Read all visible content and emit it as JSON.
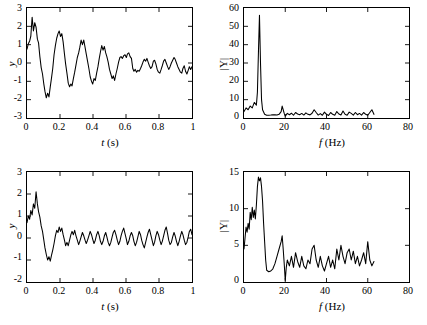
{
  "figure": {
    "background": "#ffffff",
    "line_color": "#000000",
    "panel_count": 4
  },
  "chart_data": [
    {
      "id": "top-left",
      "type": "line",
      "title": "",
      "xlabel": "t (s)",
      "ylabel": "y",
      "xlim": [
        0,
        1
      ],
      "ylim": [
        -3,
        3
      ],
      "xticks": [
        0,
        0.2,
        0.4,
        0.6,
        0.8,
        1
      ],
      "xticklabels": [
        "0",
        "0.2",
        "0.4",
        "0.6",
        "0.8",
        "1"
      ],
      "yticks": [
        -3,
        -2,
        -1,
        0,
        1,
        2,
        3
      ],
      "yticklabels": [
        "-3",
        "-2",
        "-1",
        "0",
        "1",
        "2",
        "3"
      ],
      "grid": false,
      "legend": "none",
      "description": "Noisy damped oscillation, ~7 Hz, decaying from amplitude 2.5 to noise",
      "x": [
        0,
        0.008,
        0.016,
        0.023,
        0.031,
        0.039,
        0.047,
        0.055,
        0.063,
        0.07,
        0.078,
        0.086,
        0.094,
        0.102,
        0.109,
        0.117,
        0.125,
        0.133,
        0.141,
        0.148,
        0.156,
        0.164,
        0.172,
        0.18,
        0.188,
        0.195,
        0.203,
        0.211,
        0.219,
        0.227,
        0.234,
        0.242,
        0.25,
        0.258,
        0.266,
        0.273,
        0.281,
        0.289,
        0.297,
        0.305,
        0.313,
        0.32,
        0.328,
        0.336,
        0.344,
        0.352,
        0.359,
        0.367,
        0.375,
        0.383,
        0.391,
        0.398,
        0.406,
        0.414,
        0.422,
        0.43,
        0.438,
        0.445,
        0.453,
        0.461,
        0.469,
        0.477,
        0.484,
        0.492,
        0.5,
        0.508,
        0.516,
        0.523,
        0.531,
        0.539,
        0.547,
        0.555,
        0.563,
        0.57,
        0.578,
        0.586,
        0.594,
        0.602,
        0.609,
        0.617,
        0.625,
        0.633,
        0.641,
        0.648,
        0.656,
        0.664,
        0.672,
        0.68,
        0.688,
        0.695,
        0.703,
        0.711,
        0.719,
        0.727,
        0.734,
        0.742,
        0.75,
        0.758,
        0.766,
        0.773,
        0.781,
        0.789,
        0.797,
        0.805,
        0.813,
        0.82,
        0.828,
        0.836,
        0.844,
        0.852,
        0.859,
        0.867,
        0.875,
        0.883,
        0.891,
        0.898,
        0.906,
        0.914,
        0.922,
        0.93,
        0.938,
        0.945,
        0.953,
        0.961,
        0.969,
        0.977,
        0.984,
        0.992,
        1
      ],
      "y": [
        0.75,
        1.05,
        1.2,
        1.45,
        2.5,
        1.75,
        2.2,
        1.95,
        1.3,
        1.1,
        0.35,
        -0.25,
        -0.6,
        -1.15,
        -1.55,
        -1.9,
        -1.65,
        -1.85,
        -1.3,
        -0.85,
        -0.3,
        0.45,
        0.95,
        1.35,
        1.6,
        1.75,
        1.45,
        1.6,
        1.15,
        0.5,
        -0.05,
        -0.55,
        -1.1,
        -1.3,
        -1.15,
        -1.25,
        -0.85,
        -0.5,
        -0.1,
        0.3,
        0.55,
        0.85,
        1.25,
        1.0,
        1.25,
        0.85,
        0.5,
        0.1,
        -0.3,
        -0.75,
        -1.0,
        -1.15,
        -0.85,
        -0.95,
        -0.55,
        -0.2,
        0.25,
        0.6,
        0.95,
        0.7,
        0.9,
        0.55,
        0.35,
        0.05,
        -0.35,
        -0.6,
        -0.85,
        -0.7,
        -0.95,
        -0.6,
        -0.3,
        0.05,
        0.3,
        0.35,
        0.25,
        0.4,
        0.45,
        0.3,
        0.5,
        0.55,
        0.35,
        0.25,
        -0.3,
        -0.45,
        -0.35,
        -0.5,
        -0.4,
        -0.45,
        -0.3,
        -0.15,
        0.05,
        0.2,
        0.1,
        0.25,
        0.05,
        -0.15,
        -0.3,
        -0.2,
        0.1,
        0.15,
        -0.05,
        -0.35,
        -0.5,
        -0.55,
        -0.35,
        -0.15,
        0.1,
        0.2,
        0.0,
        -0.2,
        -0.35,
        -0.2,
        0.0,
        0.15,
        0.3,
        0.2,
        0.0,
        -0.2,
        -0.35,
        -0.5,
        -0.55,
        -0.3,
        -0.15,
        -0.45,
        -0.6,
        -0.4,
        -0.2,
        -0.35,
        -0.2
      ]
    },
    {
      "id": "top-right",
      "type": "line",
      "title": "",
      "xlabel": "f (Hz)",
      "ylabel": "|Y|",
      "xlim": [
        0,
        80
      ],
      "ylim": [
        0,
        60
      ],
      "xticks": [
        0,
        20,
        40,
        60,
        80
      ],
      "xticklabels": [
        "0",
        "20",
        "40",
        "60",
        "80"
      ],
      "yticks": [
        0,
        10,
        20,
        30,
        40,
        50,
        60
      ],
      "yticklabels": [
        "0",
        "10",
        "20",
        "30",
        "40",
        "50",
        "60"
      ],
      "grid": false,
      "legend": "none",
      "description": "Magnitude spectrum with sharp peak of 56 at about 7.5 Hz, noise floor near 2",
      "peak_frequency_hz": 7.5,
      "peak_magnitude": 56,
      "data_extent_hz": 63,
      "x": [
        0,
        1,
        2,
        3,
        4,
        5,
        6,
        6.5,
        7,
        7.5,
        8,
        8.5,
        9,
        10,
        11,
        12,
        13,
        14,
        15,
        16,
        17,
        18,
        18.5,
        19,
        19.5,
        20,
        21,
        22,
        23,
        24,
        25,
        26,
        27,
        28,
        29,
        30,
        31,
        32,
        33,
        34,
        35,
        36,
        37,
        38,
        39,
        40,
        41,
        42,
        43,
        44,
        45,
        46,
        47,
        48,
        49,
        50,
        51,
        52,
        53,
        54,
        55,
        56,
        57,
        58,
        59,
        60,
        61,
        62,
        63
      ],
      "y": [
        3.5,
        5.5,
        4.5,
        6.5,
        5.5,
        8.5,
        7.0,
        14,
        36,
        56,
        30,
        10,
        4.5,
        2.0,
        1.5,
        1.5,
        1.6,
        1.8,
        1.7,
        1.6,
        2.0,
        3.5,
        6.5,
        4.5,
        2.5,
        1.0,
        2.5,
        1.8,
        2.6,
        1.5,
        3.0,
        2.2,
        1.8,
        2.5,
        1.6,
        2.8,
        2.0,
        1.7,
        2.6,
        4.5,
        3.0,
        1.6,
        2.4,
        1.5,
        3.2,
        2.0,
        1.4,
        3.0,
        2.0,
        1.5,
        3.5,
        2.2,
        1.6,
        3.8,
        2.0,
        1.5,
        3.2,
        2.5,
        1.6,
        3.0,
        1.8,
        2.5,
        1.6,
        3.0,
        2.0,
        1.5,
        3.0,
        4.5,
        2.0
      ]
    },
    {
      "id": "bottom-left",
      "type": "line",
      "title": "",
      "xlabel": "t (s)",
      "ylabel": "y",
      "xlim": [
        0,
        1
      ],
      "ylim": [
        -2,
        3
      ],
      "xticks": [
        0,
        0.2,
        0.4,
        0.6,
        0.8,
        1
      ],
      "xticklabels": [
        "0",
        "0.2",
        "0.4",
        "0.6",
        "0.8",
        "1"
      ],
      "yticks": [
        -2,
        -1,
        0,
        1,
        2,
        3
      ],
      "yticklabels": [
        "-2",
        "-1",
        "0",
        "1",
        "2",
        "3"
      ],
      "grid": false,
      "legend": "none",
      "description": "Rapidly damped noisy oscillation; initial peak 2.1, decays to noise near zero by 0.25 s",
      "x": [
        0,
        0.008,
        0.016,
        0.023,
        0.031,
        0.039,
        0.047,
        0.055,
        0.063,
        0.07,
        0.078,
        0.086,
        0.094,
        0.102,
        0.109,
        0.117,
        0.125,
        0.133,
        0.141,
        0.148,
        0.156,
        0.164,
        0.172,
        0.18,
        0.188,
        0.195,
        0.203,
        0.211,
        0.219,
        0.227,
        0.234,
        0.242,
        0.25,
        0.258,
        0.266,
        0.273,
        0.281,
        0.289,
        0.297,
        0.305,
        0.313,
        0.32,
        0.328,
        0.336,
        0.344,
        0.352,
        0.359,
        0.367,
        0.375,
        0.383,
        0.391,
        0.398,
        0.406,
        0.414,
        0.422,
        0.43,
        0.438,
        0.445,
        0.453,
        0.461,
        0.469,
        0.477,
        0.484,
        0.492,
        0.5,
        0.508,
        0.516,
        0.523,
        0.531,
        0.539,
        0.547,
        0.555,
        0.563,
        0.57,
        0.578,
        0.586,
        0.594,
        0.602,
        0.609,
        0.617,
        0.625,
        0.633,
        0.641,
        0.648,
        0.656,
        0.664,
        0.672,
        0.68,
        0.688,
        0.695,
        0.703,
        0.711,
        0.719,
        0.727,
        0.734,
        0.742,
        0.75,
        0.758,
        0.766,
        0.773,
        0.781,
        0.789,
        0.797,
        0.805,
        0.813,
        0.82,
        0.828,
        0.836,
        0.844,
        0.852,
        0.859,
        0.867,
        0.875,
        0.883,
        0.891,
        0.898,
        0.906,
        0.914,
        0.922,
        0.93,
        0.938,
        0.945,
        0.953,
        0.961,
        0.969,
        0.977,
        0.984,
        0.992,
        1
      ],
      "y": [
        0.7,
        1.0,
        0.85,
        1.25,
        1.05,
        1.55,
        1.35,
        2.1,
        1.55,
        1.2,
        0.95,
        0.55,
        0.3,
        -0.1,
        -0.45,
        -0.75,
        -1.0,
        -0.85,
        -1.05,
        -0.8,
        -0.55,
        -0.25,
        0.1,
        0.35,
        0.25,
        0.5,
        0.3,
        0.45,
        0.15,
        -0.1,
        -0.35,
        -0.2,
        -0.35,
        -0.1,
        0.15,
        0.3,
        0.15,
        0.35,
        0.1,
        -0.1,
        -0.3,
        -0.15,
        0.05,
        0.25,
        0.1,
        -0.1,
        -0.25,
        -0.1,
        0.1,
        0.3,
        0.15,
        -0.05,
        -0.25,
        -0.1,
        0.15,
        0.3,
        0.1,
        -0.15,
        -0.3,
        -0.15,
        0.1,
        0.25,
        0.05,
        -0.2,
        -0.35,
        -0.2,
        0.05,
        0.25,
        0.35,
        0.15,
        -0.1,
        -0.3,
        -0.15,
        0.1,
        0.3,
        0.45,
        0.2,
        -0.05,
        -0.3,
        -0.15,
        0.1,
        0.25,
        0.1,
        -0.15,
        -0.35,
        -0.2,
        0.05,
        0.3,
        0.15,
        -0.1,
        -0.3,
        -0.45,
        -0.2,
        0.05,
        0.25,
        0.4,
        0.15,
        -0.1,
        -0.35,
        -0.2,
        0.1,
        0.3,
        0.15,
        -0.1,
        -0.3,
        -0.15,
        0.1,
        0.35,
        0.5,
        0.2,
        -0.1,
        -0.3,
        -0.2,
        0.05,
        0.25,
        0.1,
        -0.15,
        -0.35,
        -0.15,
        0.1,
        0.3,
        0.15,
        -0.1,
        -0.3,
        -0.2,
        0.05,
        0.3,
        0.4,
        0.15,
        -0.1
      ]
    },
    {
      "id": "bottom-right",
      "type": "line",
      "title": "",
      "xlabel": "f (Hz)",
      "ylabel": "|Y|",
      "xlim": [
        0,
        80
      ],
      "ylim": [
        0,
        15
      ],
      "xticks": [
        0,
        20,
        40,
        60,
        80
      ],
      "xticklabels": [
        "0",
        "20",
        "40",
        "60",
        "80"
      ],
      "yticks": [
        0,
        5,
        10,
        15
      ],
      "yticklabels": [
        "0",
        "5",
        "10",
        "15"
      ],
      "grid": false,
      "legend": "none",
      "description": "Broad magnitude spectrum peaking near 14.3 at about 7 Hz with high noise floor about 3",
      "peak_frequency_hz": 7,
      "peak_magnitude": 14.3,
      "data_extent_hz": 63,
      "x": [
        0,
        0.5,
        1,
        1.5,
        2,
        2.5,
        3,
        3.5,
        4,
        4.5,
        5,
        5.5,
        6,
        6.5,
        7,
        7.5,
        8,
        8.5,
        9,
        9.5,
        10,
        10.5,
        11,
        12,
        13,
        14,
        15,
        16,
        17,
        18,
        18.5,
        19,
        19.5,
        20,
        20.5,
        21,
        22,
        23,
        24,
        25,
        26,
        27,
        28,
        29,
        30,
        31,
        32,
        33,
        34,
        35,
        36,
        37,
        38,
        39,
        40,
        41,
        42,
        43,
        44,
        45,
        46,
        47,
        48,
        49,
        50,
        51,
        52,
        53,
        54,
        55,
        56,
        57,
        58,
        59,
        60,
        61,
        62,
        63
      ],
      "y": [
        4.5,
        6.0,
        7.5,
        6.8,
        8.0,
        7.2,
        9.5,
        8.5,
        10.2,
        8.8,
        9.8,
        8.6,
        10.5,
        13.0,
        14.3,
        13.8,
        14.2,
        13.0,
        11.0,
        8.0,
        5.5,
        3.0,
        1.6,
        1.4,
        1.5,
        1.8,
        2.5,
        3.5,
        4.5,
        5.5,
        6.3,
        4.5,
        2.5,
        0.2,
        2.0,
        3.0,
        2.2,
        3.5,
        2.0,
        4.0,
        2.8,
        2.0,
        3.5,
        2.2,
        1.8,
        3.0,
        2.5,
        4.5,
        5.0,
        3.0,
        2.0,
        3.5,
        2.2,
        1.5,
        2.5,
        3.5,
        2.0,
        3.0,
        1.8,
        4.5,
        3.0,
        5.0,
        3.5,
        2.5,
        4.0,
        4.5,
        3.0,
        4.2,
        2.5,
        3.5,
        2.2,
        3.0,
        4.0,
        2.5,
        5.5,
        3.0,
        2.2,
        2.8
      ]
    }
  ]
}
